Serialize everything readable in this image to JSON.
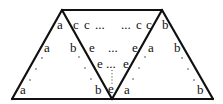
{
  "diagram": {
    "labels": {
      "left_tri": {
        "top": "a",
        "mid": "a",
        "bottom": "a"
      },
      "middle_left_edge": {
        "top": "b",
        "bottom": "b"
      },
      "middle_top_row": {
        "c1": "c",
        "c2": "c",
        "ellipsis_l": "...",
        "ellipsis_r": "...",
        "c3": "c",
        "c4": "c"
      },
      "middle_row2": {
        "e_left": "e",
        "ellipsis": "...",
        "e_right": "e"
      },
      "middle_row3": {
        "e_left": "e",
        "ellipsis": "...",
        "e_right": "e"
      },
      "middle_bottom": {
        "e": "e"
      },
      "middle_right_edge": {
        "top": "a",
        "bottom": "a"
      },
      "right_tri": {
        "top": "b",
        "mid": "b",
        "bottom": "b"
      }
    },
    "colors": {
      "stroke": "#111111",
      "text": "#111111"
    }
  }
}
